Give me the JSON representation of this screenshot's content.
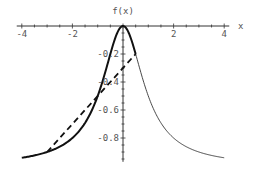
{
  "chart_data": {
    "type": "line",
    "title": "",
    "xlabel": "x",
    "ylabel": "f(x)",
    "xlim": [
      -4.2,
      4.2
    ],
    "ylim": [
      -0.97,
      0
    ],
    "grid": false,
    "x_ticks": [
      {
        "value": -4,
        "label": "-4"
      },
      {
        "value": -2,
        "label": "-2"
      },
      {
        "value": 2,
        "label": "2"
      },
      {
        "value": 4,
        "label": "4"
      }
    ],
    "y_ticks": [
      {
        "value": -0.2,
        "label": "-0.2"
      },
      {
        "value": -0.4,
        "label": "-0.4"
      },
      {
        "value": -0.6,
        "label": "-0.6"
      },
      {
        "value": -0.8,
        "label": "-0.8"
      }
    ],
    "series": [
      {
        "name": "f(x) = -x^2/(1+x^2), bold part",
        "style": "bold",
        "x": [
          -4,
          -3.5,
          -3,
          -2.5,
          -2,
          -1.75,
          -1.5,
          -1.25,
          -1,
          -0.75,
          -0.5,
          -0.25,
          0,
          0.25,
          0.5
        ],
        "y": [
          -0.941,
          -0.925,
          -0.9,
          -0.862,
          -0.8,
          -0.754,
          -0.692,
          -0.61,
          -0.5,
          -0.36,
          -0.2,
          -0.059,
          0,
          -0.059,
          -0.2
        ]
      },
      {
        "name": "f(x) = -x^2/(1+x^2), thin part",
        "style": "thin",
        "x": [
          0.5,
          0.75,
          1,
          1.25,
          1.5,
          1.75,
          2,
          2.5,
          3,
          3.5,
          4
        ],
        "y": [
          -0.2,
          -0.36,
          -0.5,
          -0.61,
          -0.692,
          -0.754,
          -0.8,
          -0.862,
          -0.9,
          -0.925,
          -0.941
        ]
      },
      {
        "name": "secant",
        "style": "dashed",
        "x": [
          -3,
          0.5
        ],
        "y": [
          -0.9,
          -0.2
        ]
      }
    ]
  }
}
